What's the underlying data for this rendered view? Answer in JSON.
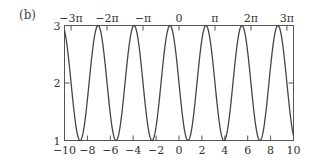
{
  "panel_label": "(b)",
  "chart_data": {
    "type": "line",
    "title": "",
    "xlabel": "",
    "ylabel": "",
    "function": "2 - sin(2x)",
    "xlim": [
      -10,
      10
    ],
    "ylim": [
      1,
      3
    ],
    "grid": false,
    "legend": null,
    "x_ticks_bottom": [
      -10,
      -8,
      -6,
      -4,
      -2,
      0,
      2,
      4,
      6,
      8,
      10
    ],
    "x_tick_labels_bottom": [
      "−10",
      "−8",
      "−6",
      "−4",
      "−2",
      "0",
      "2",
      "4",
      "6",
      "8",
      "10"
    ],
    "x_ticks_top": [
      -9.4248,
      -6.2832,
      -3.1416,
      0,
      3.1416,
      6.2832,
      9.4248
    ],
    "x_tick_labels_top": [
      "−3π",
      "−2π",
      "−π",
      "0",
      "π",
      "2π",
      "3π"
    ],
    "y_ticks": [
      1,
      2,
      3
    ],
    "y_tick_labels": [
      "1",
      "2",
      "3"
    ],
    "series": [
      {
        "name": "y",
        "x": [
          -10,
          -9.21,
          -8.64,
          -8.06,
          -7.5,
          -6.93,
          -6.36,
          -5.78,
          -5.22,
          -4.64,
          -4.07,
          -3.5,
          -2.93,
          -2.36,
          -1.79,
          -1.22,
          -0.79,
          -0.21,
          0.36,
          0.79,
          1.36,
          1.93,
          2.36,
          2.92,
          3.5,
          3.93,
          4.5,
          5.07,
          5.5,
          6.07,
          6.64,
          7.07,
          7.64,
          8.21,
          8.64,
          9.21,
          9.78,
          10
        ],
        "values": [
          1.09,
          2.39,
          1.01,
          2.53,
          2.65,
          1.03,
          2.45,
          2.94,
          1.07,
          2.13,
          2.96,
          1.34,
          1.54,
          1.0,
          2.0,
          2.64,
          3.0,
          2.42,
          1.35,
          1.0,
          1.59,
          2.66,
          3.0,
          2.44,
          1.34,
          1.0,
          1.59,
          2.66,
          3.0,
          2.44,
          1.34,
          1.0,
          1.59,
          2.66,
          3.0,
          2.44,
          1.34,
          1.09
        ],
        "color": "#444444"
      }
    ]
  }
}
